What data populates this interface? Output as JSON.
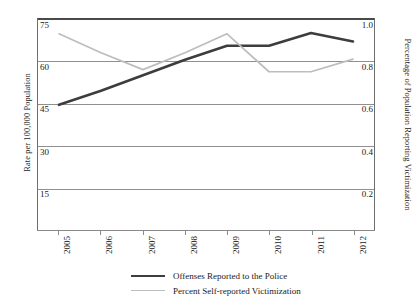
{
  "chart_data": {
    "type": "line",
    "title": "",
    "x": [
      2005,
      2006,
      2007,
      2008,
      2009,
      2010,
      2011,
      2012
    ],
    "categories": [
      "2005",
      "2006",
      "2007",
      "2008",
      "2009",
      "2010",
      "2011",
      "2012"
    ],
    "series": [
      {
        "name": "Offenses Reported to the Police",
        "axis": "left",
        "color": "#3d3d3d",
        "values": [
          44.5,
          49.5,
          55.0,
          60.5,
          65.5,
          65.5,
          70.0,
          67.0
        ]
      },
      {
        "name": "Percent Self-reported Victimization",
        "axis": "right",
        "color": "#bdbdbd",
        "values": [
          0.93,
          0.84,
          0.76,
          0.84,
          0.93,
          0.75,
          0.75,
          0.81
        ]
      }
    ],
    "xlabel": "",
    "ylabel": "Rate per 100,000 Population",
    "ylabel_right": "Percentage of Population Reporting Victimization",
    "ylim": [
      0,
      75
    ],
    "ylim_right": [
      0,
      1.0
    ],
    "yticks_left": [
      "75",
      "60",
      "45",
      "30",
      "15"
    ],
    "yticks_left_values": [
      75,
      60,
      45,
      30,
      15
    ],
    "yticks_right": [
      "1.0",
      "0.8",
      "0.6",
      "0.4",
      "0.2"
    ],
    "yticks_right_values": [
      1.0,
      0.8,
      0.6,
      0.4,
      0.2
    ],
    "grid": true,
    "legend_position": "bottom"
  },
  "axes": {
    "left_title": "Rate per 100,000 Population",
    "right_title": "Percentage of Population Reporting Victimization"
  },
  "legend": {
    "items": [
      {
        "label": "Offenses Reported to the Police",
        "style": "dark"
      },
      {
        "label": "Percent Self-reported Victimization",
        "style": "light"
      }
    ]
  }
}
